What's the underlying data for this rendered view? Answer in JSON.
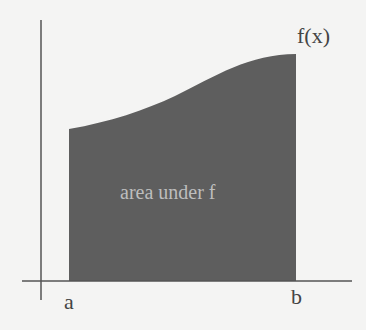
{
  "diagram": {
    "curve_label": "f(x)",
    "region_label": "area under f",
    "lower_bound_label": "a",
    "upper_bound_label": "b",
    "colors": {
      "background": "#f4f4f3",
      "fill": "#5e5e5e",
      "axes": "#555555",
      "text": "#444444",
      "region_text": "#bdbdbd"
    }
  }
}
